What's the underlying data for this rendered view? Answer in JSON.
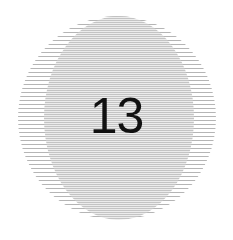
{
  "plate": {
    "number": "13",
    "line_color": "#b5b5b5",
    "background": "#ffffff",
    "text_color": "#111111"
  }
}
